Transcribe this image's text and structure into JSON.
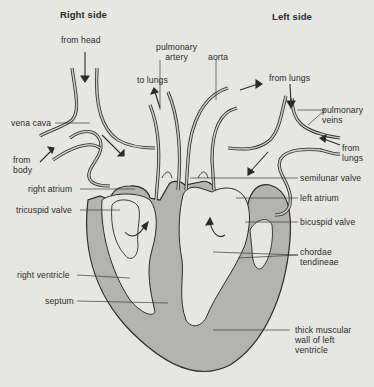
{
  "headings": {
    "right_side": "Right side",
    "left_side": "Left side"
  },
  "labels": {
    "from_head": "from head",
    "pulmonary_artery": "pulmonary\nartery",
    "aorta": "aorta",
    "to_lungs": "to lungs",
    "from_lungs_top": "from lungs",
    "pulmonary_veins": "pulmonary\nveins",
    "vena_cava": "vena cava",
    "from_body": "from\nbody",
    "from_lungs_right": "from\nlungs",
    "right_atrium": "right atrium",
    "tricuspid_valve": "tricuspid valve",
    "semilunar_valve": "semilunar valve",
    "left_atrium": "left atrium",
    "bicuspid_valve": "bicuspid valve",
    "chordae_tendineae": "chordae\ntendineae",
    "right_ventricle": "right ventricle",
    "septum": "septum",
    "thick_muscular_wall": "thick muscular\nwall of left\nventricle"
  },
  "colors": {
    "background": "#e6e6e2",
    "muscle_fill": "#b3b3b0",
    "outline": "#2a2a2a",
    "vessel_fill": "#c9c9c6"
  }
}
